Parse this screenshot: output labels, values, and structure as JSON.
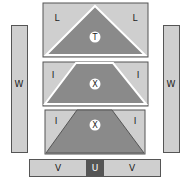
{
  "diagram": {
    "type": "pattern-layout",
    "colors": {
      "light": "#cfcfcf",
      "dark": "#8a8a8a",
      "outline": "#555555",
      "background": "#ffffff"
    },
    "pieces": {
      "left_strip": {
        "label": "W"
      },
      "right_strip": {
        "label": "W"
      },
      "top_block": {
        "left_corner": "L",
        "right_corner": "L",
        "center": "T"
      },
      "middle_block": {
        "left_corner": "I",
        "right_corner": "I",
        "center": "X"
      },
      "lower_block": {
        "left_corner": "I",
        "right_corner": "I",
        "center": "X"
      },
      "bottom_strip": {
        "left": "V",
        "center": "U",
        "right": "V"
      }
    }
  }
}
